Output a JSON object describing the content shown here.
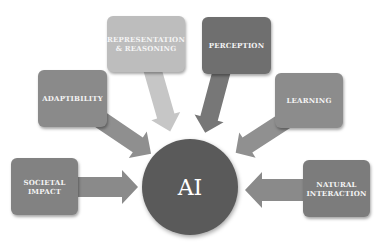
{
  "diagram": {
    "center": {
      "label": "AI",
      "color": "#5a5a5a"
    },
    "nodes": [
      {
        "id": "societal-impact",
        "label": "SOCIETAL IMPACT",
        "lines": [
          "SOCIETAL",
          "IMPACT"
        ],
        "color": "#828282"
      },
      {
        "id": "adaptability",
        "label": "ADAPTIBILITY",
        "lines": [
          "ADAPTIBILITY"
        ],
        "color": "#8a8a8a"
      },
      {
        "id": "representation-reasoning",
        "label": "REPRESENTATION & REASONING",
        "lines": [
          "REPRESENTATION",
          "& REASONING"
        ],
        "color": "#bdbdbd"
      },
      {
        "id": "perception",
        "label": "PERCEPTION",
        "lines": [
          "PERCEPTION"
        ],
        "color": "#6f6f6f"
      },
      {
        "id": "learning",
        "label": "LEARNING",
        "lines": [
          "LEARNING"
        ],
        "color": "#8c8c8c"
      },
      {
        "id": "natural-interaction",
        "label": "NATURAL INTERACTION",
        "lines": [
          "NATURAL",
          "INTERACTION"
        ],
        "color": "#7c7c7c"
      }
    ],
    "edges": [
      {
        "from": "societal-impact",
        "to": "AI"
      },
      {
        "from": "adaptability",
        "to": "AI"
      },
      {
        "from": "representation-reasoning",
        "to": "AI"
      },
      {
        "from": "perception",
        "to": "AI"
      },
      {
        "from": "learning",
        "to": "AI"
      },
      {
        "from": "natural-interaction",
        "to": "AI"
      }
    ]
  }
}
